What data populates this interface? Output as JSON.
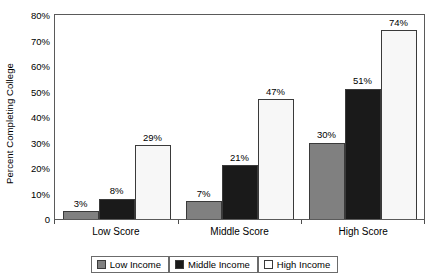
{
  "chart_data": {
    "type": "bar",
    "title": "",
    "subtitle": "",
    "xlabel": "",
    "ylabel": "Percent Completing College",
    "categories": [
      "Low Score",
      "Middle Score",
      "High Score"
    ],
    "series": [
      {
        "name": "Low Income",
        "values": [
          3,
          7,
          30
        ],
        "color": "#808080"
      },
      {
        "name": "Middle Income",
        "values": [
          8,
          21,
          51
        ],
        "color": "#1a1a1a"
      },
      {
        "name": "High Income",
        "values": [
          29,
          47,
          74
        ],
        "color": "#ffffff"
      }
    ],
    "data_labels": [
      [
        "3%",
        "7%",
        "30%"
      ],
      [
        "8%",
        "21%",
        "51%"
      ],
      [
        "29%",
        "47%",
        "74%"
      ]
    ],
    "ylim": [
      0,
      80
    ],
    "ytick_values": [
      0,
      10,
      20,
      30,
      40,
      50,
      60,
      70,
      80
    ],
    "ytick_labels": [
      "0",
      "10%",
      "20%",
      "30%",
      "40%",
      "50%",
      "60%",
      "70%",
      "80%"
    ],
    "grid": false,
    "legend_position": "bottom",
    "grouping": "grouped"
  }
}
